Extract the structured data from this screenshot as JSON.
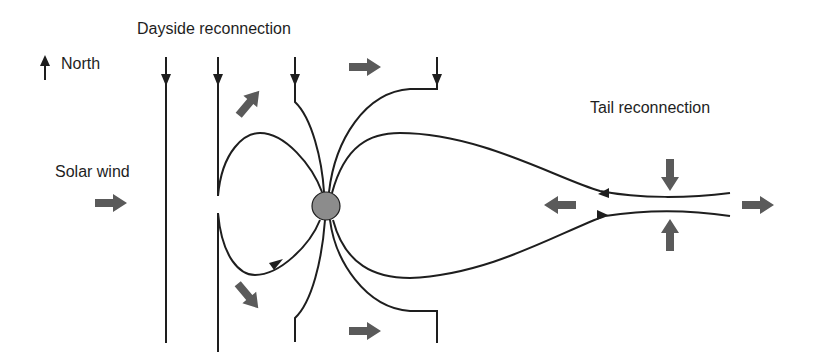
{
  "diagram": {
    "labels": {
      "dayside": "Dayside reconnection",
      "north": "North",
      "solar_wind": "Solar wind",
      "tail": "Tail reconnection"
    },
    "colors": {
      "line": "#1e1e1e",
      "flow_arrow": "#5a5a5a",
      "earth": "#8c8c8c"
    },
    "elements": [
      "north-arrow",
      "interplanetary-field-lines",
      "earth",
      "closed-field-lines",
      "open-field-lines",
      "plasma-flow-arrows",
      "tail-x-line"
    ]
  }
}
